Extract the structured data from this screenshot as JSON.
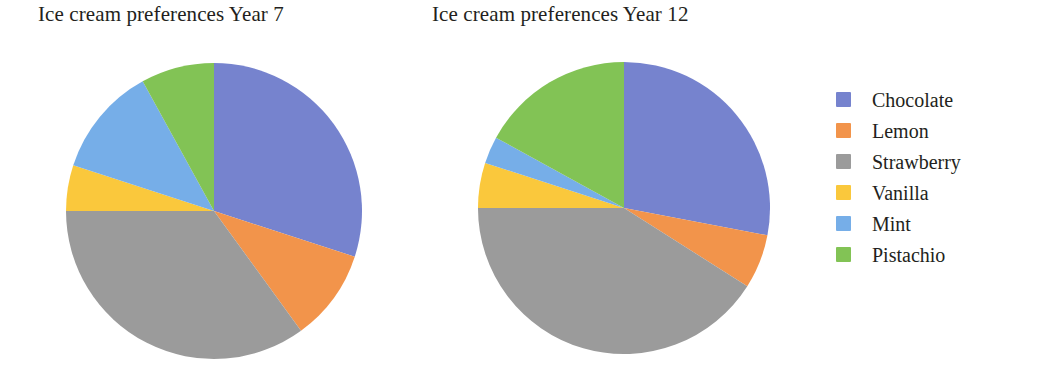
{
  "figure": {
    "background": "#ffffff"
  },
  "legend": {
    "position": "right",
    "items": [
      {
        "label": "Chocolate",
        "color": "#7683ce"
      },
      {
        "label": "Lemon",
        "color": "#f2944b"
      },
      {
        "label": "Strawberry",
        "color": "#9b9b9b"
      },
      {
        "label": "Vanilla",
        "color": "#fac83c"
      },
      {
        "label": "Mint",
        "color": "#76aee8"
      },
      {
        "label": "Pistachio",
        "color": "#82c355"
      }
    ]
  },
  "charts": {
    "year7": {
      "title": "Ice cream preferences Year 7"
    },
    "year12": {
      "title": "Ice cream preferences Year 12"
    }
  },
  "chart_data": [
    {
      "type": "pie",
      "title": "Ice cream preferences Year 7",
      "xlabel": "",
      "ylabel": "",
      "categories": [
        "Chocolate",
        "Lemon",
        "Strawberry",
        "Vanilla",
        "Mint",
        "Pistachio"
      ],
      "values": [
        30,
        10,
        35,
        5,
        12,
        8
      ],
      "unit": "percent",
      "colors": [
        "#7683ce",
        "#f2944b",
        "#9b9b9b",
        "#fac83c",
        "#76aee8",
        "#82c355"
      ],
      "start_angle_deg": 0,
      "direction": "clockwise",
      "grid": false,
      "legend": "right"
    },
    {
      "type": "pie",
      "title": "Ice cream preferences Year 12",
      "xlabel": "",
      "ylabel": "",
      "categories": [
        "Chocolate",
        "Lemon",
        "Strawberry",
        "Vanilla",
        "Mint",
        "Pistachio"
      ],
      "values": [
        28,
        6,
        41,
        5,
        3,
        17
      ],
      "unit": "percent",
      "colors": [
        "#7683ce",
        "#f2944b",
        "#9b9b9b",
        "#fac83c",
        "#76aee8",
        "#82c355"
      ],
      "start_angle_deg": 0,
      "direction": "clockwise",
      "grid": false,
      "legend": "right"
    }
  ]
}
